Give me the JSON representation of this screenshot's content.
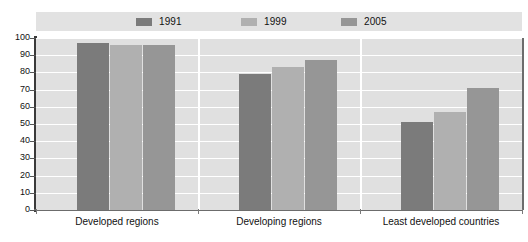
{
  "chart_data": {
    "type": "bar",
    "title": "",
    "subtitle": "",
    "xlabel": "",
    "ylabel": "",
    "ylim": [
      0,
      100
    ],
    "ytick_values": [
      100,
      90,
      80,
      70,
      60,
      50,
      40,
      30,
      20,
      10,
      0
    ],
    "ytick_labels": [
      "100",
      "90",
      "80",
      "70",
      "60",
      "50",
      "40",
      "30",
      "20",
      "10",
      "0"
    ],
    "grid": true,
    "grid_orientation": "horizontal",
    "legend_position": "top-center",
    "categories": [
      "Developed regions",
      "Developing regions",
      "Least developed countries"
    ],
    "series": [
      {
        "name": "1991",
        "color": "#7b7b7b",
        "values": [
          97,
          79,
          51
        ]
      },
      {
        "name": "1999",
        "color": "#b0b0b0",
        "values": [
          96,
          83,
          57
        ]
      },
      {
        "name": "2005",
        "color": "#969696",
        "values": [
          96,
          87,
          71
        ]
      }
    ]
  },
  "legend": {
    "items": [
      {
        "label": "1991",
        "color": "#7b7b7b"
      },
      {
        "label": "1999",
        "color": "#b0b0b0"
      },
      {
        "label": "2005",
        "color": "#969696"
      }
    ]
  },
  "axes": {
    "y_labels": [
      "100",
      "90",
      "80",
      "70",
      "60",
      "50",
      "40",
      "30",
      "20",
      "10",
      "0"
    ],
    "x_labels": [
      "Developed regions",
      "Developing regions",
      "Least developed countries"
    ]
  },
  "colors": {
    "plot_background": "#e0e0e0",
    "legend_background": "#e2e2e2",
    "gridline": "#ffffff",
    "axis": "#3a3a3a",
    "text": "#111111"
  }
}
